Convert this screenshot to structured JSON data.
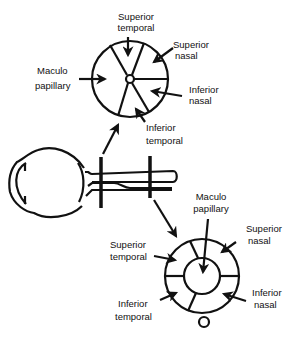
{
  "diagram": {
    "top_circle": {
      "labels": {
        "superior_temporal": [
          "Superior",
          "temporal"
        ],
        "superior_nasal": [
          "Superior",
          "nasal"
        ],
        "maculo_papillary": [
          "Maculo",
          "papillary"
        ],
        "inferior_nasal": [
          "Inferior",
          "nasal"
        ],
        "inferior_temporal": [
          "Inferior",
          "temporal"
        ]
      }
    },
    "bottom_circle": {
      "labels": {
        "maculo_papillary": [
          "Maculo",
          "papillary"
        ],
        "superior_temporal": [
          "Superior",
          "temporal"
        ],
        "superior_nasal": [
          "Superior",
          "nasal"
        ],
        "inferior_temporal": [
          "Inferior",
          "temporal"
        ],
        "inferior_nasal": [
          "Inferior",
          "nasal"
        ]
      }
    },
    "colors": {
      "ink": "#111111",
      "background": "#ffffff"
    }
  }
}
